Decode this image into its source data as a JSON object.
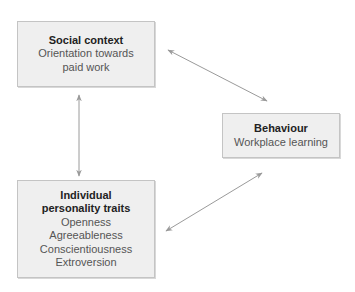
{
  "diagram": {
    "nodes": {
      "social": {
        "title": "Social context",
        "lines": [
          "Orientation towards",
          "paid work"
        ]
      },
      "behaviour": {
        "title": "Behaviour",
        "lines": [
          "Workplace learning"
        ]
      },
      "personality": {
        "title_lines": [
          "Individual",
          "personality traits"
        ],
        "lines": [
          "Openness",
          "Agreeableness",
          "Conscientiousness",
          "Extroversion"
        ]
      }
    },
    "edges": [
      {
        "from": "social",
        "to": "behaviour",
        "type": "bidirectional-arrow"
      },
      {
        "from": "social",
        "to": "personality",
        "type": "bidirectional-arrow"
      },
      {
        "from": "personality",
        "to": "behaviour",
        "type": "bidirectional-arrow"
      }
    ],
    "colors": {
      "box_fill": "#efefef",
      "box_border": "#c4c4c4",
      "arrow": "#9a9a9a",
      "title_text": "#222222",
      "body_text": "#555555"
    }
  }
}
